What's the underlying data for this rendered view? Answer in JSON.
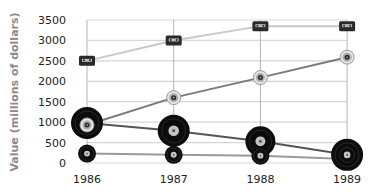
{
  "chart_data": {
    "type": "line",
    "title": "",
    "xlabel": "",
    "ylabel": "Value (millions of dollars)",
    "categories": [
      "1986",
      "1987",
      "1988",
      "1989"
    ],
    "yticks": [
      0,
      500,
      1000,
      1500,
      2000,
      2500,
      3000,
      3500
    ],
    "ylim": [
      0,
      3500
    ],
    "grid": true,
    "legend": "none (pictogram markers)",
    "series": [
      {
        "name": "Cassettes",
        "marker": "cassette-icon",
        "color": "#c8c8c8",
        "values": [
          2500,
          3000,
          3350,
          3350
        ]
      },
      {
        "name": "CDs",
        "marker": "cd-icon",
        "color": "#7a7a7a",
        "values": [
          930,
          1600,
          2090,
          2590
        ]
      },
      {
        "name": "LPs",
        "marker": "lp-record-icon",
        "color": "#555555",
        "values": [
          980,
          790,
          530,
          200
        ]
      },
      {
        "name": "Singles",
        "marker": "single-record-icon",
        "color": "#9a9a9a",
        "values": [
          230,
          200,
          180,
          100
        ]
      }
    ]
  }
}
